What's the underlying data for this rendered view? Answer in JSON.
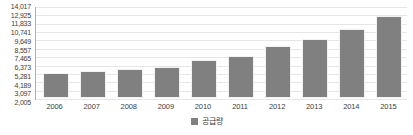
{
  "chart_data": {
    "type": "bar",
    "title": "",
    "xlabel": "",
    "ylabel": "",
    "categories": [
      "2006",
      "2007",
      "2008",
      "2009",
      "2010",
      "2011",
      "2012",
      "2013",
      "2014",
      "2015"
    ],
    "values": [
      5281,
      5554,
      5827,
      6100,
      6919,
      7465,
      8830,
      9649,
      11013,
      12653
    ],
    "series": [
      {
        "name": "공급량",
        "color": "#808080",
        "values": [
          5281,
          5554,
          5827,
          6100,
          6919,
          7465,
          8830,
          9649,
          11013,
          12653
        ]
      }
    ],
    "ylim": [
      2005,
      14017
    ],
    "ytick_values": [
      14017,
      12925,
      11833,
      10741,
      9649,
      8557,
      7465,
      6373,
      5281,
      4189,
      3097,
      2005
    ],
    "ytick_labels": [
      "14,017",
      "12,925",
      "11,833",
      "10,741",
      "9,649",
      "8,557",
      "7,465",
      "6,373",
      "5,281",
      "4,189",
      "3,097",
      "2,005"
    ],
    "grid": true,
    "legend_position": "bottom",
    "legend": [
      "공급량"
    ]
  },
  "legend": {
    "label": "공급량",
    "swatch_color": "#808080"
  },
  "colors": {
    "bar": "#808080",
    "grid": "#e6e6e6",
    "axis": "#b0b0b0",
    "text": "#404040"
  }
}
